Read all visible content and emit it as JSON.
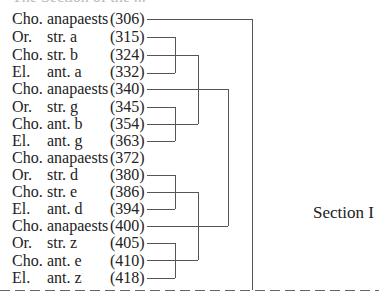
{
  "top_fragment": "The Section of the ...",
  "rows": [
    {
      "speaker": "Cho.",
      "part": "anapaests",
      "line": "(306)"
    },
    {
      "speaker": "Or.",
      "part": "str. a",
      "line": "(315)"
    },
    {
      "speaker": "Cho.",
      "part": "str. b",
      "line": "(324)"
    },
    {
      "speaker": "El.",
      "part": "ant. a",
      "line": "(332)"
    },
    {
      "speaker": "Cho.",
      "part": "anapaests",
      "line": "(340)"
    },
    {
      "speaker": "Or.",
      "part": "str. g",
      "line": "(345)"
    },
    {
      "speaker": "Cho.",
      "part": "ant. b",
      "line": "(354)"
    },
    {
      "speaker": "El.",
      "part": "ant. g",
      "line": "(363)"
    },
    {
      "speaker": "Cho.",
      "part": "anapaests",
      "line": "(372)"
    },
    {
      "speaker": "Or.",
      "part": "str. d",
      "line": "(380)"
    },
    {
      "speaker": "Cho.",
      "part": "str. e",
      "line": "(386)"
    },
    {
      "speaker": "El.",
      "part": "ant. d",
      "line": "(394)"
    },
    {
      "speaker": "Cho.",
      "part": "anapaests",
      "line": "(400)"
    },
    {
      "speaker": "Or.",
      "part": "str. z",
      "line": "(405)"
    },
    {
      "speaker": "Cho.",
      "part": "ant. e",
      "line": "(410)"
    },
    {
      "speaker": "El.",
      "part": "ant. z",
      "line": "(418)"
    }
  ],
  "section_label": "Section I",
  "colors": {
    "text": "#222222",
    "lines": "#555555"
  }
}
